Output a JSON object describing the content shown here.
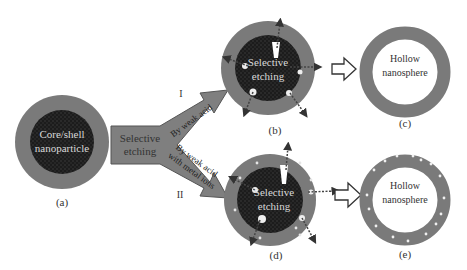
{
  "diagram": {
    "colors": {
      "shell": "#7a7a7a",
      "core": "#1e1e1e",
      "arrow_fill": "#7f7f7f",
      "arrow_stroke": "#555555",
      "text_light": "#d8d8d8",
      "text_dark": "#333333",
      "hollow": "#ffffff"
    },
    "nodes": {
      "a": {
        "label_lines": [
          "Core/shell",
          "nanoparticle"
        ],
        "caption": "(a)"
      },
      "b": {
        "label_lines": [
          "Selective",
          "etching"
        ],
        "caption": "(b)"
      },
      "c": {
        "label_lines": [
          "Hollow",
          "nanosphere"
        ],
        "caption": "(c)"
      },
      "d": {
        "label_lines": [
          "Selective",
          "etching"
        ],
        "caption": "(d)"
      },
      "e": {
        "label_lines": [
          "Hollow",
          "nanosphere"
        ],
        "caption": "(e)"
      }
    },
    "arrows": {
      "main": {
        "label_lines": [
          "Selective",
          "etching"
        ]
      },
      "route_I": {
        "roman": "I",
        "label": "By weak acid"
      },
      "route_II": {
        "roman": "II",
        "label_lines": [
          "By weak acid",
          "with metal ions"
        ]
      }
    }
  }
}
